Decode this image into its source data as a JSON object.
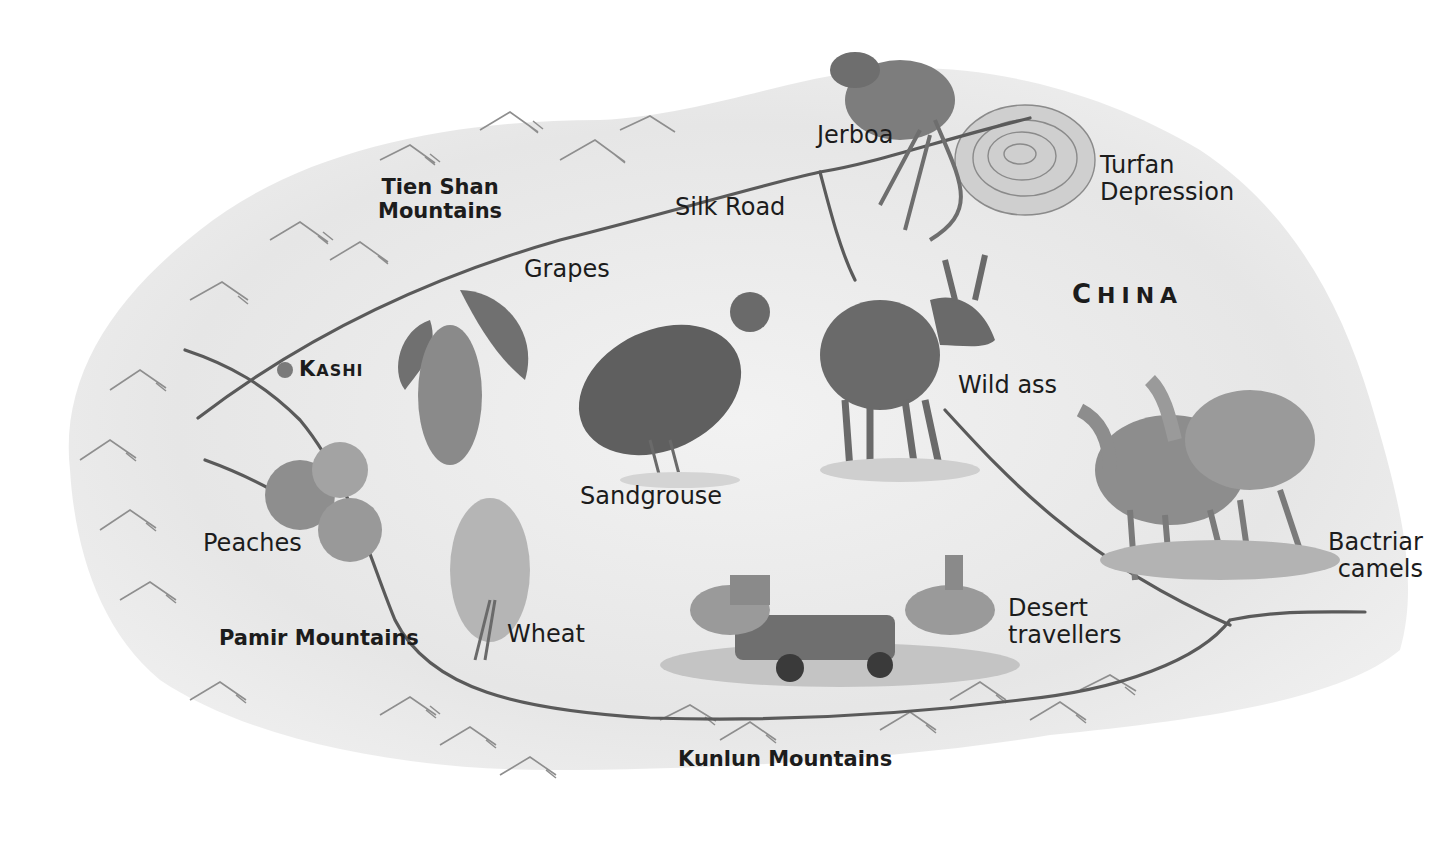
{
  "map": {
    "country": {
      "initial": "C",
      "rest": "HINA"
    },
    "city": {
      "name_initial": "K",
      "name_rest": "ASHI"
    },
    "route_label": "Silk Road",
    "regions": [
      {
        "line1": "Tien Shan",
        "line2": "Mountains"
      },
      {
        "name": "Pamir Mountains"
      },
      {
        "name": "Kunlun Mountains"
      },
      {
        "line1": "Turfan",
        "line2": "Depression"
      }
    ],
    "features": [
      {
        "name": "Jerboa"
      },
      {
        "name": "Grapes"
      },
      {
        "name": "Sandgrouse"
      },
      {
        "name": "Wild ass"
      },
      {
        "name": "Peaches"
      },
      {
        "name": "Wheat"
      },
      {
        "line1": "Desert",
        "line2": "travellers"
      },
      {
        "line1": "Bactriar",
        "line2": "camels"
      }
    ],
    "colors": {
      "land_wash": "#e4e4e4",
      "route_line": "#5a5a5a",
      "city_dot": "#7a7a7a",
      "text": "#1c1c1c"
    }
  }
}
